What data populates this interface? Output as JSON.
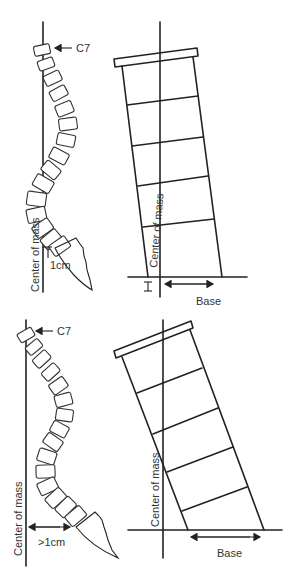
{
  "figure": {
    "panels": [
      {
        "id": "balanced",
        "spine": {
          "vertebra_label": "C7",
          "plumb_line_label": "Center of mass",
          "offset_label": "1cm"
        },
        "tower": {
          "center_line_label": "Center of mass",
          "base_label": "Base"
        }
      },
      {
        "id": "imbalanced",
        "spine": {
          "vertebra_label": "C7",
          "plumb_line_label": "Center of mass",
          "offset_label": ">1cm"
        },
        "tower": {
          "center_line_label": "Center of mass",
          "base_label": "Base"
        }
      }
    ]
  }
}
